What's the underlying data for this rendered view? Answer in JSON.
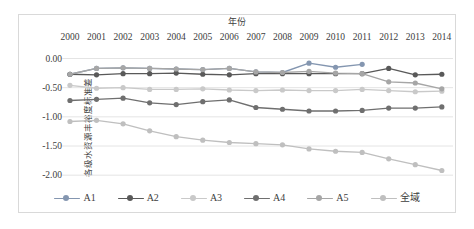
{
  "chart_data": {
    "type": "line",
    "title": "年份",
    "xlabel": "年份",
    "ylabel": "各级水资源丰裕度标准差",
    "categories": [
      "2000",
      "2001",
      "2002",
      "2003",
      "2004",
      "2005",
      "2006",
      "2007",
      "2008",
      "2009",
      "2010",
      "2011",
      "2012",
      "2013",
      "2014"
    ],
    "ylim": [
      -2.1,
      0.06
    ],
    "yticks": [
      "0.00",
      "-0.50",
      "-1.00",
      "-1.50",
      "-2.00"
    ],
    "ytick_values": [
      0.0,
      -0.5,
      -1.0,
      -1.5,
      -2.0
    ],
    "grid": true,
    "legend_position": "bottom",
    "series": [
      {
        "name": "A1",
        "color": "#8496b0",
        "values": [
          -0.27,
          -0.17,
          -0.16,
          -0.17,
          -0.18,
          -0.19,
          -0.17,
          -0.23,
          -0.24,
          -0.08,
          -0.15,
          -0.1,
          null,
          null,
          null
        ]
      },
      {
        "name": "A2",
        "color": "#595959",
        "values": [
          -0.27,
          -0.28,
          -0.26,
          -0.26,
          -0.25,
          -0.27,
          -0.28,
          -0.26,
          -0.26,
          -0.26,
          -0.26,
          -0.26,
          -0.17,
          -0.28,
          -0.27
        ]
      },
      {
        "name": "A3",
        "color": "#c9c9c9",
        "values": [
          -0.46,
          -0.51,
          -0.5,
          -0.53,
          -0.53,
          -0.52,
          -0.54,
          -0.55,
          -0.54,
          -0.55,
          -0.55,
          -0.53,
          -0.55,
          -0.57,
          -0.56
        ]
      },
      {
        "name": "A4",
        "color": "#6f6f6f",
        "values": [
          -0.72,
          -0.7,
          -0.68,
          -0.76,
          -0.79,
          -0.74,
          -0.71,
          -0.84,
          -0.87,
          -0.9,
          -0.9,
          -0.89,
          -0.85,
          -0.85,
          -0.83
        ]
      },
      {
        "name": "A5",
        "color": "#a6a6a6",
        "values": [
          -0.27,
          -0.17,
          -0.16,
          -0.17,
          -0.18,
          -0.19,
          -0.17,
          -0.23,
          -0.24,
          -0.22,
          -0.25,
          -0.26,
          -0.4,
          -0.42,
          -0.52
        ]
      },
      {
        "name": "全域",
        "color": "#bfbfbf",
        "values": [
          -1.08,
          -1.06,
          -1.12,
          -1.24,
          -1.34,
          -1.4,
          -1.44,
          -1.46,
          -1.48,
          -1.55,
          -1.59,
          -1.61,
          -1.72,
          -1.82,
          -1.92
        ]
      }
    ]
  },
  "legend": {
    "items": [
      {
        "label": "A1",
        "color": "#8496b0"
      },
      {
        "label": "A2",
        "color": "#595959"
      },
      {
        "label": "A3",
        "color": "#c9c9c9"
      },
      {
        "label": "A4",
        "color": "#6f6f6f"
      },
      {
        "label": "A5",
        "color": "#a6a6a6"
      },
      {
        "label": "全域",
        "color": "#bfbfbf"
      }
    ]
  },
  "axes": {
    "x_title": "年份",
    "y_title": "各级水资源丰裕度标准差"
  },
  "colors": {
    "grid": "#e4e4e4",
    "frame": "#d9d9d9",
    "text": "#3d3d3d",
    "background": "#ffffff"
  }
}
